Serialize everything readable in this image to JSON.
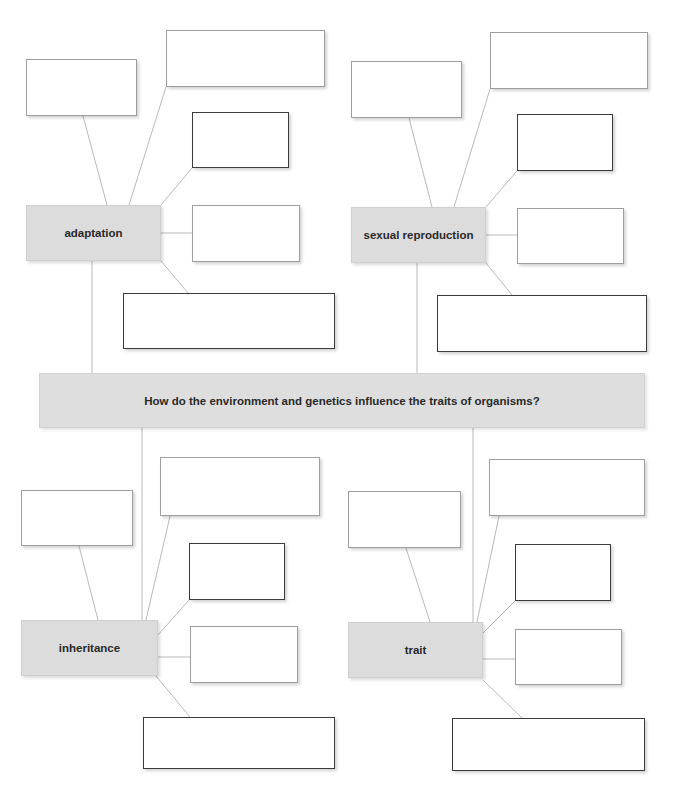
{
  "central_question": {
    "text": "How do the environment and genetics influence the traits of organisms?"
  },
  "concepts": [
    {
      "id": "adaptation",
      "label": "adaptation",
      "answer_boxes": [
        "",
        "",
        "",
        "",
        ""
      ]
    },
    {
      "id": "sexual-reproduction",
      "label": "sexual reproduction",
      "answer_boxes": [
        "",
        "",
        "",
        "",
        ""
      ]
    },
    {
      "id": "inheritance",
      "label": "inheritance",
      "answer_boxes": [
        "",
        "",
        "",
        "",
        ""
      ]
    },
    {
      "id": "trait",
      "label": "trait",
      "answer_boxes": [
        "",
        "",
        "",
        "",
        ""
      ]
    }
  ],
  "colors": {
    "concept_fill": "#dcdcdc",
    "question_fill": "#dedede",
    "connector": "#b9b9b9",
    "box_border_light": "#9e9e9e",
    "box_border_dark": "#3c3c3c"
  }
}
